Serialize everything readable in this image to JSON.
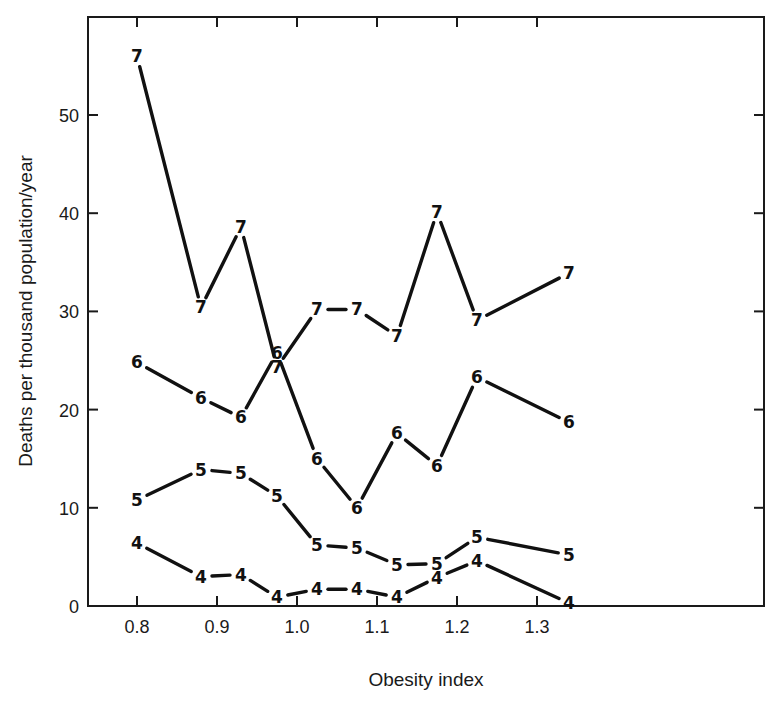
{
  "chart_data": {
    "type": "line",
    "title": "",
    "xlabel": "Obesity index",
    "ylabel": "Deaths per thousand population/year",
    "xlim": [
      0.74,
      1.42
    ],
    "ylim": [
      0,
      58
    ],
    "x_ticks": [
      "0.8",
      "0.9",
      "1.0",
      "1.1",
      "1.2",
      "1.3"
    ],
    "y_ticks": [
      "0",
      "10",
      "20",
      "30",
      "40",
      "50"
    ],
    "grid": false,
    "legend": "none (series identified by numeric marker labels on each point)",
    "x": [
      0.8,
      0.88,
      0.93,
      0.975,
      1.025,
      1.075,
      1.125,
      1.175,
      1.225,
      1.34
    ],
    "series": [
      {
        "name": "7",
        "marker": "7",
        "values": [
          56.0,
          30.4,
          38.6,
          24.3,
          30.2,
          30.2,
          27.5,
          40.1,
          29.1,
          33.9
        ]
      },
      {
        "name": "6",
        "marker": "6",
        "values": [
          24.8,
          21.2,
          19.2,
          25.8,
          15.0,
          10.0,
          17.6,
          14.3,
          23.3,
          18.7
        ]
      },
      {
        "name": "5",
        "marker": "5",
        "values": [
          10.8,
          13.9,
          13.5,
          11.2,
          6.2,
          5.9,
          4.2,
          4.3,
          7.0,
          5.2
        ]
      },
      {
        "name": "4",
        "marker": "4",
        "values": [
          6.4,
          3.0,
          3.2,
          0.9,
          1.7,
          1.7,
          0.9,
          2.9,
          4.6,
          0.3
        ]
      }
    ]
  },
  "axes": {
    "x_title": "Obesity index",
    "y_title": "Deaths per thousand population/year",
    "x_tick_labels": [
      "0.8",
      "0.9",
      "1.0",
      "1.1",
      "1.2",
      "1.3"
    ],
    "y_tick_labels": [
      "0",
      "10",
      "20",
      "30",
      "40",
      "50"
    ]
  }
}
